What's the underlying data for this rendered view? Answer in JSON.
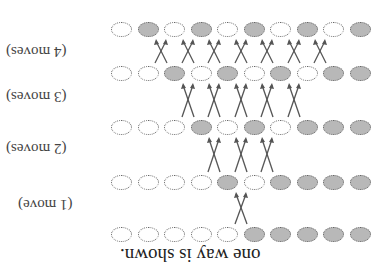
{
  "title": "one way is shown.",
  "labels": [
    "(1 move)",
    "(2 moves)",
    "(3 moves)",
    "(4 moves)"
  ],
  "rows": [
    "WGWGWGWGWG",
    "WWGWGWGWGG",
    "WWWGWGWGGG",
    "WWWWGWGGGG",
    "WWWWWGGGGG"
  ],
  "colors": {
    "grey": "#b8b8b8",
    "white": "#ffffff"
  }
}
